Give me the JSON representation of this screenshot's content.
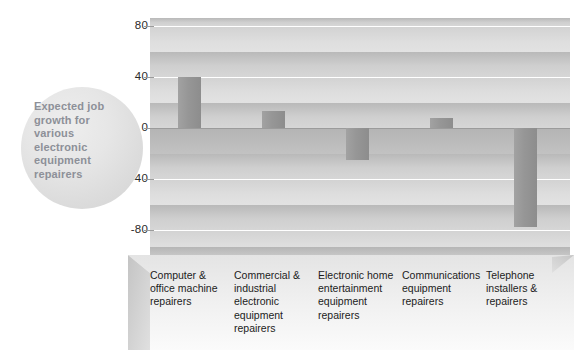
{
  "chart_data": {
    "type": "bar",
    "title": "Expected job growth for various electronic equipment repairers",
    "xlabel": "",
    "ylabel": "",
    "ylim": [
      -100,
      95
    ],
    "yticks": [
      80,
      40,
      0,
      -40,
      -80
    ],
    "ytick_labels": [
      "80",
      "40",
      "0",
      "-40",
      "-80"
    ],
    "grid": true,
    "legend": "none",
    "categories": [
      "Computer & office machine repairers",
      "Commercial & industrial electronic equipment repairers",
      "Electronic home entertainment equipment repairers",
      "Communications equipment repairers",
      "Telephone installers & repairers"
    ],
    "values": [
      40,
      13,
      -25,
      8,
      -78
    ],
    "bar_color": "#949494",
    "background_band_colors": [
      "#c6c6c6",
      "#dcdcdc"
    ],
    "zero_line_color": "#9b9b9b"
  },
  "callout": {
    "text": "Expected job growth for various electronic equipment repairers",
    "text_color": "#8d9098",
    "fill_color": "#e2e2e2"
  },
  "axis": {
    "ticks": [
      {
        "label": "80",
        "value": 80
      },
      {
        "label": "40",
        "value": 40
      },
      {
        "label": "0",
        "value": 0
      },
      {
        "label": "-40",
        "value": -40
      },
      {
        "label": "-80",
        "value": -80
      }
    ]
  },
  "categories": [
    {
      "label": "Computer & office machine repairers"
    },
    {
      "label": "Commercial & industrial electronic equipment repairers"
    },
    {
      "label": "Electronic home entertainment equipment repairers"
    },
    {
      "label": "Communications equipment repairers"
    },
    {
      "label": "Telephone installers & repairers"
    }
  ]
}
